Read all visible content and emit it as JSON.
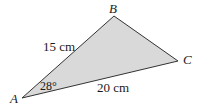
{
  "diagram": {
    "type": "triangle",
    "fill_color": "#d9d9d9",
    "stroke_color": "#333333",
    "vertices": [
      {
        "name": "A",
        "x": 22,
        "y": 98
      },
      {
        "name": "B",
        "x": 114,
        "y": 16
      },
      {
        "name": "C",
        "x": 178,
        "y": 61
      }
    ],
    "labels": {
      "vertex_a": "A",
      "vertex_b": "B",
      "vertex_c": "C",
      "side_ab": "15 cm",
      "side_ac": "20 cm",
      "angle_a": "28°"
    }
  }
}
